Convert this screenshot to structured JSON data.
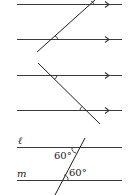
{
  "figures": [
    {
      "id": "figure-1",
      "description": "Two parallel lines cut by a transversal; corresponding angles marked",
      "parallel_lines": [
        {
          "y": 4,
          "x1": 17,
          "x2": 122,
          "arrow_x": 108
        },
        {
          "y": 39,
          "x1": 17,
          "x2": 122,
          "arrow_x": 108
        }
      ],
      "transversal": {
        "x1": 37,
        "y1": 52,
        "x2": 95,
        "y2": 0
      },
      "angle_marks": 2
    },
    {
      "id": "figure-2",
      "description": "Two parallel lines cut by a transversal; alternate angles marked",
      "parallel_lines": [
        {
          "y": 75,
          "x1": 17,
          "x2": 122,
          "arrow_x": 108
        },
        {
          "y": 110,
          "x1": 17,
          "x2": 122,
          "arrow_x": 108
        }
      ],
      "transversal": {
        "x1": 38,
        "y1": 63,
        "x2": 100,
        "y2": 124
      },
      "angle_marks": 2
    },
    {
      "id": "figure-3",
      "description": "Lines l and m cut by a transversal with two 60 degree angles",
      "line_labels": [
        "ℓ",
        "m"
      ],
      "angle_labels": [
        "60°",
        "60°"
      ],
      "lines": [
        {
          "name": "ℓ",
          "y": 147,
          "x1": 17,
          "x2": 122
        },
        {
          "name": "m",
          "y": 180,
          "x1": 17,
          "x2": 122
        }
      ],
      "transversal": {
        "x1": 55,
        "y1": 195,
        "x2": 85,
        "y2": 138
      }
    }
  ]
}
